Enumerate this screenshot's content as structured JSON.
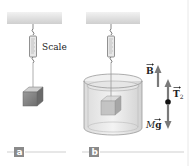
{
  "figure": {
    "panels": [
      {
        "id": "a",
        "label": "a",
        "scale_label": "Scale"
      },
      {
        "id": "b",
        "label": "b"
      }
    ],
    "forces": {
      "buoyant": {
        "symbol": "B"
      },
      "tension": {
        "symbol": "T",
        "subscript": "2"
      },
      "weight": {
        "prefix": "M",
        "symbol": "g"
      }
    },
    "colors": {
      "ceiling": "#d4d4d4",
      "arrow": "#7a7a7a",
      "panel_tag": "#8a8a8a",
      "rule": "#b0b0b0"
    }
  }
}
